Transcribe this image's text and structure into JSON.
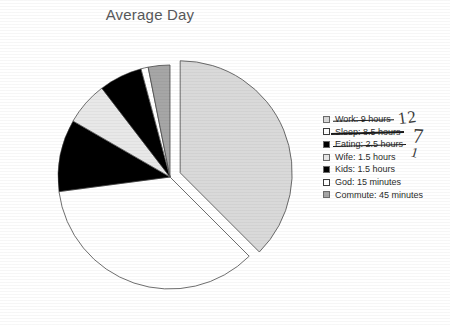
{
  "chart_data": {
    "type": "pie",
    "title": "Average Day",
    "xlabel": "",
    "ylabel": "",
    "unit": "hours",
    "total_hours": 24,
    "legend_position": "right",
    "grid": false,
    "categories": [
      "Work",
      "Sleep",
      "Eating",
      "Wife",
      "Kids",
      "God",
      "Commute"
    ],
    "values": [
      9,
      8.5,
      2.5,
      1.5,
      1.5,
      0.25,
      0.75
    ],
    "value_labels": [
      "9 hours",
      "8.5 hours",
      "2.5 hours",
      "1.5 hours",
      "1.5 hours",
      "15 minutes",
      "45 minutes"
    ],
    "colors": [
      "#d9d9d9",
      "#ffffff",
      "#000000",
      "#e8e8e8",
      "#000000",
      "#ffffff",
      "#a6a6a6"
    ],
    "slice_exploded": [
      true,
      false,
      false,
      false,
      false,
      false,
      false
    ],
    "slices": [
      {
        "label": "Work",
        "value_label": "9 hours",
        "hours": 9,
        "color": "#d9d9d9",
        "exploded": true
      },
      {
        "label": "Sleep",
        "value_label": "8.5 hours",
        "hours": 8.5,
        "color": "#ffffff",
        "exploded": false
      },
      {
        "label": "Eating",
        "value_label": "2.5 hours",
        "hours": 2.5,
        "color": "#000000",
        "exploded": false
      },
      {
        "label": "Wife",
        "value_label": "1.5 hours",
        "hours": 1.5,
        "color": "#e8e8e8",
        "exploded": false
      },
      {
        "label": "Kids",
        "value_label": "1.5 hours",
        "hours": 1.5,
        "color": "#000000",
        "exploded": false
      },
      {
        "label": "God",
        "value_label": "15 minutes",
        "hours": 0.25,
        "color": "#ffffff",
        "exploded": false
      },
      {
        "label": "Commute",
        "value_label": "45 minutes",
        "hours": 0.75,
        "color": "#a6a6a6",
        "exploded": false
      }
    ],
    "annotations": [
      {
        "id": "work-correction",
        "text": "12",
        "target": "Work"
      },
      {
        "id": "sleep-correction",
        "text": "7",
        "target": "Sleep"
      },
      {
        "id": "eating-correction",
        "text": "1",
        "target": "Eating"
      }
    ]
  },
  "chart": {
    "title": "Average Day"
  },
  "legend": {
    "entries": [
      {
        "label": "Work: 9 hours",
        "swatch": "#d9d9d9",
        "struck": true
      },
      {
        "label": "Sleep: 8.5 hours",
        "swatch": "#ffffff",
        "struck": true
      },
      {
        "label": "Eating: 2.5 hours",
        "swatch": "#000000",
        "struck": true
      },
      {
        "label": "Wife: 1.5 hours",
        "swatch": "#e8e8e8",
        "struck": false
      },
      {
        "label": "Kids: 1.5 hours",
        "swatch": "#000000",
        "struck": false
      },
      {
        "label": "God: 15 minutes",
        "swatch": "#ffffff",
        "struck": false
      },
      {
        "label": "Commute: 45 minutes",
        "swatch": "#a6a6a6",
        "struck": false
      }
    ]
  },
  "annotations": {
    "work": "12",
    "sleep": "7",
    "eating": "1"
  }
}
